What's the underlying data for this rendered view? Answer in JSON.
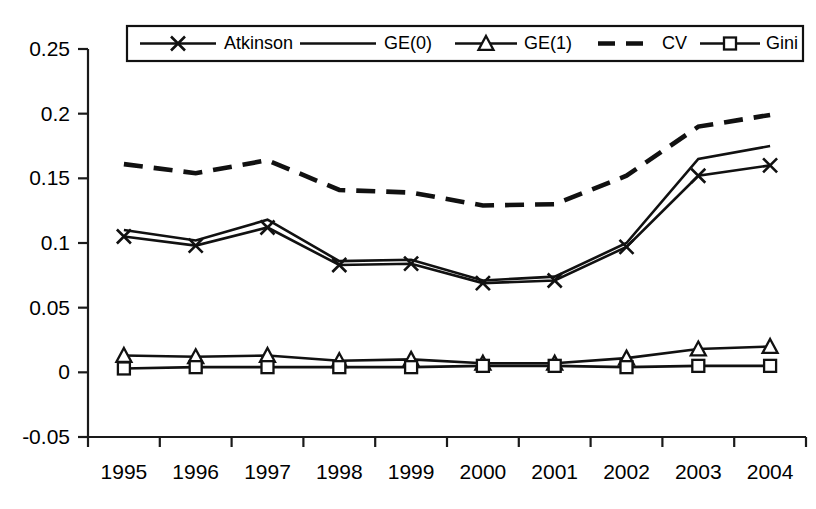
{
  "chart_data": {
    "type": "line",
    "title": "",
    "xlabel": "",
    "ylabel": "",
    "categories": [
      "1995",
      "1996",
      "1997",
      "1998",
      "1999",
      "2000",
      "2001",
      "2002",
      "2003",
      "2004"
    ],
    "ylim": [
      -0.05,
      0.25
    ],
    "ytick_labels": [
      "0.25",
      "0.2",
      "0.15",
      "0.1",
      "0.05",
      "0",
      "-0.05"
    ],
    "ytick_values": [
      0.25,
      0.2,
      0.15,
      0.1,
      0.05,
      0,
      -0.05
    ],
    "grid": false,
    "legend_position": "top-center",
    "series": [
      {
        "name": "Atkinson",
        "marker": "x",
        "dash": false,
        "values": [
          0.105,
          0.098,
          0.112,
          0.083,
          0.084,
          0.069,
          0.071,
          0.097,
          0.152,
          0.16
        ]
      },
      {
        "name": "GE(0)",
        "marker": "none",
        "dash": false,
        "values": [
          0.11,
          0.102,
          0.118,
          0.086,
          0.087,
          0.071,
          0.074,
          0.1,
          0.165,
          0.175
        ]
      },
      {
        "name": "GE(1)",
        "marker": "triangle",
        "dash": false,
        "values": [
          0.013,
          0.012,
          0.013,
          0.009,
          0.01,
          0.007,
          0.007,
          0.011,
          0.018,
          0.02
        ]
      },
      {
        "name": "CV",
        "marker": "none",
        "dash": true,
        "values": [
          0.161,
          0.154,
          0.164,
          0.141,
          0.139,
          0.129,
          0.13,
          0.152,
          0.19,
          0.199
        ]
      },
      {
        "name": "Gini",
        "marker": "square",
        "dash": false,
        "values": [
          0.003,
          0.004,
          0.004,
          0.004,
          0.004,
          0.005,
          0.005,
          0.004,
          0.005,
          0.005
        ]
      }
    ]
  },
  "legend": {
    "entries": [
      {
        "label": "Atkinson"
      },
      {
        "label": "GE(0)"
      },
      {
        "label": "GE(1)"
      },
      {
        "label": "CV"
      },
      {
        "label": "Gini"
      }
    ]
  },
  "colors": {
    "line": "#111111",
    "axis": "#1a1a1a",
    "background": "#ffffff"
  }
}
